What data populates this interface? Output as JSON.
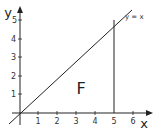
{
  "diagram": {
    "axes": {
      "x_label": "x",
      "y_label": "y",
      "x_ticks": [
        "1",
        "2",
        "3",
        "4",
        "5",
        "6"
      ],
      "y_ticks": [
        "1",
        "2",
        "3",
        "4",
        "5"
      ]
    },
    "line_label": "y = x",
    "region_label": "F",
    "vertical_line_at": "5",
    "colors": {
      "stroke": "#222222",
      "background": "#ffffff"
    }
  }
}
